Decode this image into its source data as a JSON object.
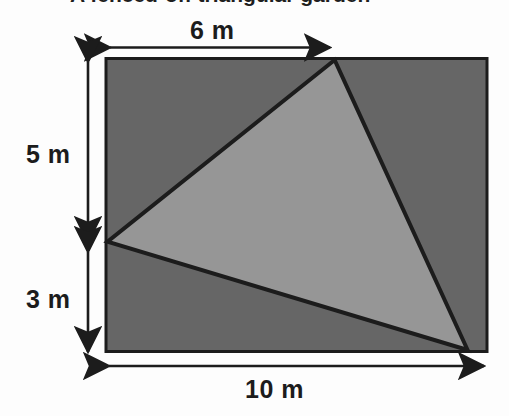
{
  "figure": {
    "caption": "A fenced-off triangular garden",
    "background_color": "#fdfdfd",
    "outline_color": "#1c1c1c",
    "rectangle": {
      "name": "plot-rectangle",
      "fill_color": "#666666",
      "width_m": 10,
      "height_m": 8
    },
    "triangle": {
      "name": "garden-triangle",
      "fill_color": "#969696",
      "vertices_m": [
        {
          "label": "top",
          "x": 6,
          "y": 0
        },
        {
          "label": "left",
          "x": 0,
          "y": 5
        },
        {
          "label": "bottom-right",
          "x": 9.5,
          "y": 8
        }
      ]
    },
    "dimensions": [
      {
        "id": "top-width",
        "label": "6 m",
        "value": 6,
        "unit": "m",
        "orientation": "horizontal",
        "side": "top"
      },
      {
        "id": "left-upper",
        "label": "5 m",
        "value": 5,
        "unit": "m",
        "orientation": "vertical",
        "side": "left"
      },
      {
        "id": "left-lower",
        "label": "3 m",
        "value": 3,
        "unit": "m",
        "orientation": "vertical",
        "side": "left"
      },
      {
        "id": "bottom-width",
        "label": "10 m",
        "value": 10,
        "unit": "m",
        "orientation": "horizontal",
        "side": "bottom"
      }
    ]
  }
}
